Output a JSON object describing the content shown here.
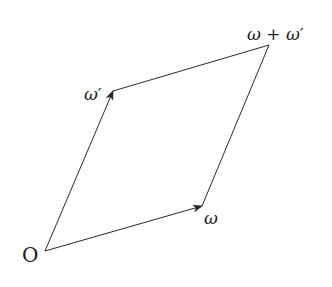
{
  "diagram": {
    "type": "vector-parallelogram",
    "colors": {
      "line": "#2a2a2a",
      "text": "#1a1a1a",
      "background": "#ffffff"
    },
    "vertices": {
      "origin": {
        "x": 45,
        "y": 251,
        "label": "O"
      },
      "omega": {
        "x": 202,
        "y": 206,
        "label": "ω"
      },
      "omega_prime": {
        "x": 113,
        "y": 91,
        "label": "ω′"
      },
      "sum": {
        "x": 269,
        "y": 45,
        "label": "ω + ω′"
      }
    },
    "edges": [
      {
        "from": "origin",
        "to": "omega",
        "arrow": true
      },
      {
        "from": "origin",
        "to": "omega_prime",
        "arrow": true
      },
      {
        "from": "omega_prime",
        "to": "sum",
        "arrow": false
      },
      {
        "from": "omega",
        "to": "sum",
        "arrow": false
      }
    ],
    "labels": {
      "origin": "O",
      "omega": "ω",
      "omega_prime": "ω′",
      "sum": "ω + ω′"
    }
  }
}
